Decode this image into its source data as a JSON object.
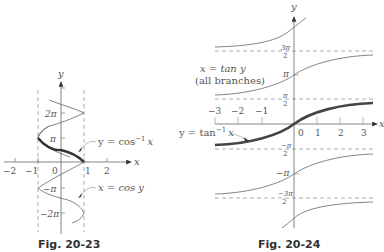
{
  "figures": [
    {
      "id": "fig-20-23",
      "caption": "Fig. 20-23",
      "axes": {
        "x_label": "x",
        "y_label": "y",
        "x_ticks": [
          "−2",
          "−1",
          "0",
          "1",
          "2"
        ],
        "y_ticks": [
          "2π",
          "π",
          "−π",
          "−2π"
        ]
      },
      "curves": [
        {
          "name": "x = cos y",
          "label": "x = cos y",
          "style": "thin"
        },
        {
          "name": "y = cos⁻¹ x",
          "label_main": "y = cos",
          "label_sup": "−1",
          "label_var": "x",
          "style": "bold"
        }
      ],
      "asymptotes_dashed": [
        "x = −1",
        "x = 1"
      ]
    },
    {
      "id": "fig-20-24",
      "caption": "Fig. 20-24",
      "axes": {
        "x_label": "x",
        "y_label": "y",
        "x_ticks": [
          "−3",
          "−2",
          "−1",
          "0",
          "1",
          "2",
          "3"
        ],
        "y_ticks": {
          "three_pi_over_2": {
            "num": "3π",
            "den": "2"
          },
          "pi": "π",
          "pi_over_2": {
            "num": "π",
            "den": "2"
          },
          "neg_pi_over_2": {
            "num": "−π",
            "den": "2"
          },
          "neg_pi": "−π",
          "neg_three_pi_over_2": {
            "num": "−3π",
            "den": "2"
          }
        }
      },
      "curves": [
        {
          "name": "x = tan y (all branches)",
          "label_line1": "x = tan y",
          "label_line2": "(all branches)",
          "style": "thin"
        },
        {
          "name": "y = tan⁻¹ x",
          "label_main": "y = tan",
          "label_sup": "−1",
          "label_var": "x",
          "style": "bold"
        }
      ],
      "asymptotes_dashed": [
        "y = 3π/2",
        "y = π/2",
        "y = −π/2",
        "y = −3π/2"
      ]
    }
  ]
}
